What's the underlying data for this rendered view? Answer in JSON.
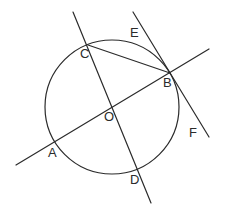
{
  "diagram": {
    "type": "geometry-circle-tangent",
    "circle": {
      "center": "O",
      "cx": 112,
      "cy": 107,
      "r": 67
    },
    "points": {
      "A": {
        "x": 54,
        "y": 142,
        "label": "A",
        "lx": 48,
        "ly": 157
      },
      "B": {
        "x": 170,
        "y": 73,
        "label": "B",
        "lx": 163,
        "ly": 87
      },
      "C": {
        "x": 88,
        "y": 45,
        "label": "C",
        "lx": 80,
        "ly": 58
      },
      "D": {
        "x": 138,
        "y": 170,
        "label": "D",
        "lx": 130,
        "ly": 184
      },
      "O": {
        "x": 112,
        "y": 107,
        "label": "O",
        "lx": 104,
        "ly": 121
      },
      "E": {
        "label": "E",
        "lx": 130,
        "ly": 37
      },
      "F": {
        "label": "F",
        "lx": 189,
        "ly": 137
      }
    },
    "lines": [
      {
        "name": "line-AB",
        "x1": 16,
        "y1": 165,
        "x2": 209,
        "y2": 49
      },
      {
        "name": "line-CD",
        "x1": 73,
        "y1": 12,
        "x2": 151,
        "y2": 203
      },
      {
        "name": "tangent-EF",
        "x1": 133,
        "y1": 12,
        "x2": 209,
        "y2": 137
      },
      {
        "name": "chord-CB",
        "x1": 88,
        "y1": 45,
        "x2": 170,
        "y2": 73
      }
    ],
    "labels": {
      "A": "A",
      "B": "B",
      "C": "C",
      "D": "D",
      "O": "O",
      "E": "E",
      "F": "F"
    }
  }
}
